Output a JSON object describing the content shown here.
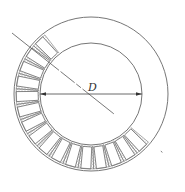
{
  "diagram": {
    "title": "",
    "dimension_label": "D",
    "colors": {
      "line": "#555555",
      "background": "#ffffff",
      "stipple": "#777777"
    },
    "geometry": {
      "center": [
        91,
        94
      ],
      "outer_circle_radius": 77,
      "inner_circle_radius": 51,
      "segment_inner_radius": 52,
      "segment_outer_radius": 75,
      "segment_count": 16,
      "segment_start_deg": 128,
      "segment_end_deg": 320,
      "section_line": {
        "from": [
          12,
          33
        ],
        "to": [
          172,
          160
        ]
      }
    }
  }
}
